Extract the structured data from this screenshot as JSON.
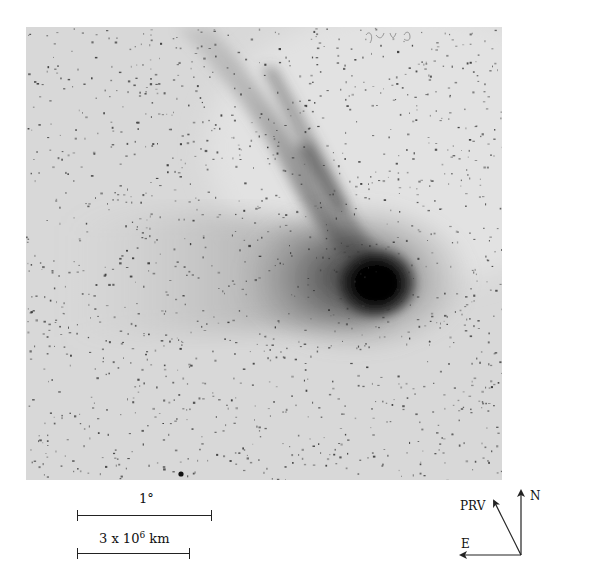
{
  "figure": {
    "type": "astronomical photograph",
    "colors": {
      "sky_background": "#d6d6d6",
      "comet_head": "#0a0a0a",
      "stars": "#3a3a3a",
      "annotation_ink": "#222222"
    }
  },
  "scale_bars": {
    "angular": {
      "label": "1°"
    },
    "physical": {
      "label_prefix": "3 x 10",
      "label_exponent": "6",
      "label_unit": " km"
    }
  },
  "compass": {
    "north_label": "N",
    "east_label": "E",
    "prv_label": "PRV"
  },
  "handwritten_note": "illegible pencil marks at top edge"
}
